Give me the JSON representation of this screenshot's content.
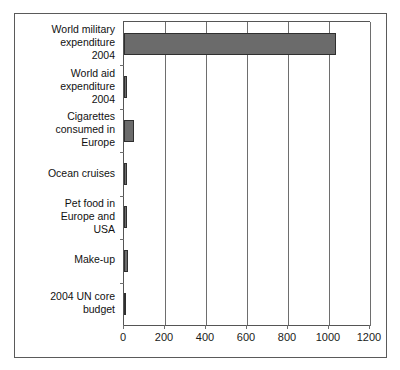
{
  "figure": {
    "top_cropped_text": "",
    "frame_color": "#5a5a5a",
    "background": "#ffffff"
  },
  "chart_data": {
    "type": "bar",
    "orientation": "horizontal",
    "title": "",
    "xlabel": "",
    "ylabel": "",
    "grid": true,
    "legend": null,
    "xlim": [
      0,
      1200
    ],
    "xticks": [
      0,
      200,
      400,
      600,
      800,
      1000,
      1200
    ],
    "xticklabels": [
      "0",
      "200",
      "400",
      "600",
      "800",
      "1000",
      "1200"
    ],
    "bar_fill_color": "#6b6b6b",
    "bar_edge_color": "#2f2f2f",
    "categories": [
      "World military\nexpenditure\n2004",
      "World aid\nexpenditure\n2004",
      "Cigarettes\nconsumed in\nEurope",
      "Ocean cruises",
      "Pet food in\nEurope and\nUSA",
      "Make-up",
      "2004 UN core\nbudget"
    ],
    "values": [
      1035,
      15,
      50,
      14,
      17,
      18,
      3
    ]
  }
}
